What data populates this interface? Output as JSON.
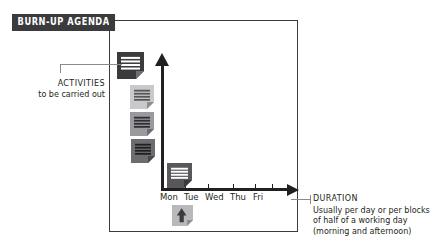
{
  "title": {
    "text": "BURN-UP AGENDA",
    "badge_color": "#3b3a3c",
    "text_color": "#ffffff"
  },
  "chart_data": {
    "type": "diagram",
    "title": "BURN-UP AGENDA",
    "xlabel": "DURATION",
    "ylabel": "ACTIVITIES",
    "categories": [
      "Mon",
      "Tue",
      "Wed",
      "Thu",
      "Fri"
    ],
    "grid": false,
    "legend": "none",
    "series": [
      {
        "name": "activities",
        "note": "stack of document icons descending toward the origin",
        "values": [
          4,
          3,
          2,
          1,
          0
        ]
      }
    ],
    "axes": {
      "y": {
        "label": "ACTIVITIES",
        "arrow": "up",
        "ticks": []
      },
      "x": {
        "label": "DURATION",
        "arrow": "right",
        "ticks": [
          "Mon",
          "Tue",
          "Wed",
          "Thu",
          "Fri"
        ]
      }
    }
  },
  "documents": [
    {
      "name": "activity-doc-1",
      "fill": "#3b3a3c",
      "line_color": "#ffffff",
      "fold": "#6f6e71",
      "x": 117,
      "y": 52,
      "w": 27,
      "h": 27,
      "lines": 4
    },
    {
      "name": "activity-doc-2",
      "fill": "#c9c9cb",
      "line_color": "#56555a",
      "fold": "#8e8e91",
      "x": 130,
      "y": 85,
      "w": 24,
      "h": 24,
      "lines": 4
    },
    {
      "name": "activity-doc-3",
      "fill": "#9a999d",
      "line_color": "#2e2d31",
      "fold": "#6c6b6f",
      "x": 130,
      "y": 112,
      "w": 24,
      "h": 24,
      "lines": 4
    },
    {
      "name": "activity-doc-4",
      "fill": "#6d6c70",
      "line_color": "#201f22",
      "fold": "#4a494d",
      "x": 131,
      "y": 139,
      "w": 24,
      "h": 24,
      "lines": 4
    },
    {
      "name": "activity-doc-5",
      "fill": "#58575b",
      "line_color": "#ffffff",
      "fold": "#3a393d",
      "x": 167,
      "y": 163,
      "w": 25,
      "h": 25,
      "lines": 4
    }
  ],
  "arrow_doc": {
    "name": "burnup-arrow-doc",
    "fill": "#b9b9bb",
    "arrow_color": "#3b3a3c",
    "fold": "#8e8e91",
    "x": 172,
    "y": 205,
    "w": 21,
    "h": 21
  },
  "x_ticks": [
    {
      "label": "Mon",
      "x": 162
    },
    {
      "label": "Tue",
      "x": 185
    },
    {
      "label": "Wed",
      "x": 208
    },
    {
      "label": "Thu",
      "x": 233
    },
    {
      "label": "Fri",
      "x": 255
    },
    {
      "label": "",
      "x": 272
    }
  ],
  "day_labels": [
    {
      "label": "Mon",
      "left": 0
    },
    {
      "label": "Tue",
      "left": 24
    },
    {
      "label": "Wed",
      "left": 45
    },
    {
      "label": "Thu",
      "left": 70
    },
    {
      "label": "Fri",
      "left": 93
    }
  ],
  "callouts": {
    "activities": {
      "heading": "ACTIVITIES",
      "body": "to be carried out"
    },
    "duration": {
      "heading": "DURATION",
      "line1": "Usually per day or per blocks",
      "line2": "of half of a working day",
      "line3": "(morning and afternoon)"
    }
  },
  "colors": {
    "ink": "#231f20",
    "frame": "#3b3a3c",
    "leader": "#8a8a8d",
    "background": "#ffffff"
  }
}
